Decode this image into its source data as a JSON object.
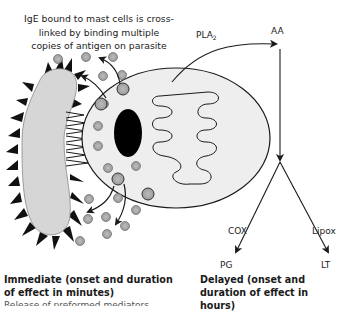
{
  "caption": {
    "top": "IgE bound to mast cells is cross-linked by binding multiple copies of antigen on parasite"
  },
  "pathway": {
    "enzyme_pla": "PLA",
    "enzyme_pla_subscript": "2",
    "product_aa": "AA",
    "enzyme_cox": "COX",
    "enzyme_lipox": "Lipox",
    "product_pg": "PG",
    "product_lt": "LT"
  },
  "headings": {
    "immediate": "Immediate (onset and duration of effect in minutes)",
    "delayed": "Delayed (onset and duration of effect in hours)",
    "cut_off_line": "Release of preformed mediators"
  },
  "colors": {
    "cell_fill": "#eeeeee",
    "parasite_fill": "#d6d6d6",
    "spike_fill": "#111111",
    "granule_fill": "#aaaaaa",
    "nucleus_fill": "#000000",
    "line": "#1a1a1a"
  }
}
